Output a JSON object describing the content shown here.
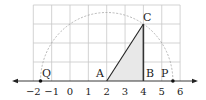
{
  "diagram": {
    "type": "coordinate-geometry",
    "axis": {
      "ticks": [
        "−2",
        "−1",
        "0",
        "1",
        "2",
        "3",
        "4",
        "5",
        "6"
      ],
      "tick_values": [
        -2,
        -1,
        0,
        1,
        2,
        3,
        4,
        5,
        6
      ]
    },
    "grid": {
      "x_range": [
        -2,
        6
      ],
      "y_range": [
        0,
        4
      ]
    },
    "points": {
      "A": {
        "label": "A",
        "x": 2,
        "y": 0
      },
      "B": {
        "label": "B",
        "x": 4,
        "y": 0
      },
      "C": {
        "label": "C",
        "x": 4,
        "y": 3
      },
      "P": {
        "label": "P",
        "x": 5.606,
        "y": 0
      },
      "Q": {
        "label": "Q",
        "x": -1.606,
        "y": 0
      }
    },
    "arc": {
      "center": "A",
      "radius_through": "C"
    },
    "colors": {
      "grid": "#c8c8c8",
      "shade": "#e6e6e6",
      "line": "#222222",
      "arc": "#999999"
    }
  }
}
